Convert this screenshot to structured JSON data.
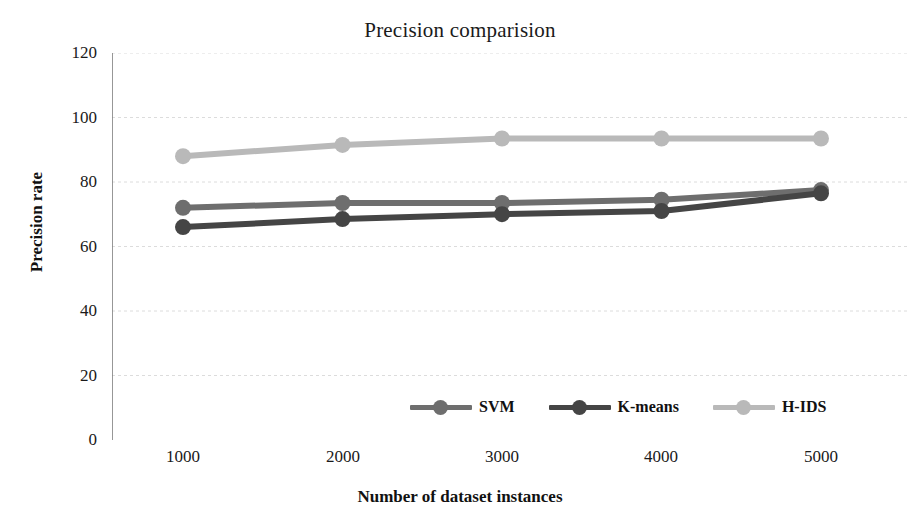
{
  "chart_data": {
    "type": "line",
    "title": "Precision comparision",
    "xlabel": "Number of dataset instances",
    "ylabel": "Precision rate",
    "x": [
      1000,
      2000,
      3000,
      4000,
      5000
    ],
    "xtick_labels": [
      "1000",
      "2000",
      "3000",
      "4000",
      "5000"
    ],
    "ytick_labels": [
      "0",
      "20",
      "40",
      "60",
      "80",
      "100",
      "120"
    ],
    "yticks": [
      0,
      20,
      40,
      60,
      80,
      100,
      120
    ],
    "ylim": [
      0,
      120
    ],
    "xlim": [
      1000,
      5000
    ],
    "grid": "horizontal-dotted",
    "legend_position": "bottom-center",
    "series": [
      {
        "name": "SVM",
        "values": [
          72,
          73.5,
          73.5,
          74.5,
          77.5
        ],
        "color": "#6e6e6e"
      },
      {
        "name": "K-means",
        "values": [
          66,
          68.5,
          70,
          71,
          76.5
        ],
        "color": "#454545"
      },
      {
        "name": "H-IDS",
        "values": [
          88,
          91.5,
          93.5,
          93.5,
          93.5
        ],
        "color": "#b9b9b9"
      }
    ]
  },
  "axis_color": "#808080",
  "grid_color": "#d9d9d9"
}
